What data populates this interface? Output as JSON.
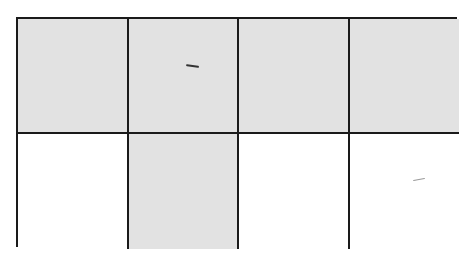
{
  "diagram": {
    "type": "fraction-grid",
    "rows": 2,
    "columns": 4,
    "shaded_color": "#e2e2e2",
    "unshaded_color": "#ffffff",
    "border_color": "#1a1a1a",
    "cells": [
      {
        "row": 0,
        "col": 0,
        "shaded": true
      },
      {
        "row": 0,
        "col": 1,
        "shaded": true
      },
      {
        "row": 0,
        "col": 2,
        "shaded": true
      },
      {
        "row": 0,
        "col": 3,
        "shaded": true
      },
      {
        "row": 1,
        "col": 0,
        "shaded": false
      },
      {
        "row": 1,
        "col": 1,
        "shaded": true
      },
      {
        "row": 1,
        "col": 2,
        "shaded": false
      },
      {
        "row": 1,
        "col": 3,
        "shaded": false
      }
    ],
    "shaded_count": 5,
    "total_count": 8
  }
}
